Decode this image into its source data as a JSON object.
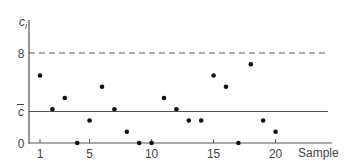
{
  "chart_data": {
    "type": "scatter",
    "title": "",
    "xlabel": "Sample",
    "ylabel": "c_i",
    "ylabel_main": "c",
    "ylabel_sub": "i",
    "x": [
      1,
      2,
      3,
      4,
      5,
      6,
      7,
      8,
      9,
      10,
      11,
      12,
      13,
      14,
      15,
      16,
      17,
      18,
      19,
      20
    ],
    "values": [
      6,
      3,
      4,
      0,
      2,
      5,
      3,
      1,
      0,
      0,
      4,
      3,
      2,
      2,
      6,
      5,
      0,
      7,
      2,
      1
    ],
    "xticks": [
      1,
      5,
      10,
      15,
      20
    ],
    "xtick_labels": [
      "1",
      "5",
      "10",
      "15",
      "20"
    ],
    "yticks": [
      {
        "value": 0,
        "label": "0"
      },
      {
        "value": 2.8,
        "label": "c̄"
      },
      {
        "value": 8,
        "label": "8"
      }
    ],
    "reference_lines": [
      {
        "name": "center line",
        "value": 2.8,
        "label": "c̄",
        "style": "solid"
      },
      {
        "name": "upper control limit",
        "value": 8,
        "label": "8",
        "style": "dashed"
      }
    ],
    "ylim": [
      0,
      9
    ],
    "xlim": [
      0,
      21
    ],
    "grid": false,
    "legend": null
  }
}
